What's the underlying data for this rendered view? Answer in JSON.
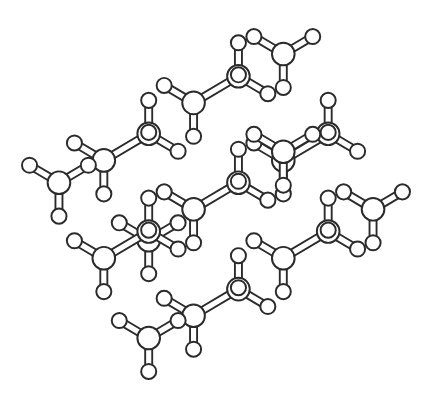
{
  "figure": {
    "caption": "",
    "background_color": "#ffffff",
    "line_color": "#2b2b2b",
    "fill_color": "#ffffff",
    "width": 429,
    "height": 408,
    "style": "ball-and-stick line drawing, monochrome"
  },
  "chart_data": {
    "type": "scatter",
    "title": "Hydrogen-terminated diamond-cubic nanocluster",
    "xlabel": "",
    "ylabel": "",
    "projection": "orthographic along [110]",
    "lattice": {
      "type": "diamond-cubic",
      "lattice_constant_px": 74.0,
      "basis_fractional": [
        [
          0.0,
          0.0,
          0.0
        ],
        [
          0.25,
          0.25,
          0.25
        ]
      ],
      "cell_range_min": -2,
      "cell_range_max": 2,
      "cluster_shape": "octahedral-rhombic",
      "radius_cutoff": 2.28,
      "bond_cutoff_px": 34.0
    },
    "camera": {
      "rot_y_deg": 45.0,
      "rot_x_deg": 33.0,
      "rot_z_deg": 0.0,
      "center_x": 216,
      "center_y": 203,
      "scale": 1.0
    },
    "atoms": {
      "core_label": "heavy atom",
      "core_radius_px": 6.6,
      "terminal_label": "terminal hydrogen",
      "terminal_radius_px": 4.4,
      "terminal_bond_length_px": 21.0
    },
    "bonds": {
      "style": "outlined double-line stick",
      "outer_width_px": 5.2,
      "inner_width_px": 3.0,
      "edge_width_px": 1.15
    },
    "extents_px": {
      "left": 22,
      "right": 410,
      "top": 20,
      "bottom": 388
    }
  }
}
